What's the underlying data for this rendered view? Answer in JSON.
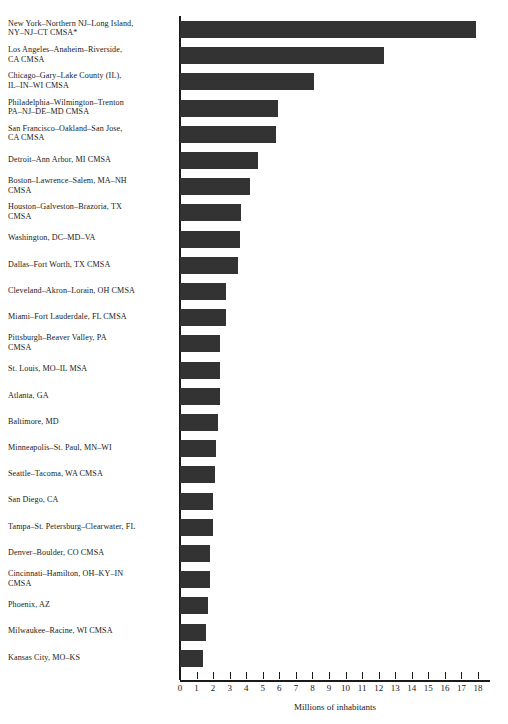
{
  "chart_data": {
    "type": "bar",
    "orientation": "horizontal",
    "title": "",
    "subtitle": "",
    "xlabel": "Millions of inhabitants",
    "ylabel": "",
    "xlim": [
      0,
      18
    ],
    "grid": false,
    "legend": null,
    "xticks": [
      0,
      1,
      2,
      3,
      4,
      5,
      6,
      7,
      8,
      9,
      10,
      11,
      12,
      13,
      14,
      15,
      16,
      17,
      18
    ],
    "xtick_labels": [
      "0",
      "1",
      "2",
      "3",
      "4",
      "5",
      "6",
      "7",
      "8",
      "9",
      "10",
      "11",
      "12",
      "13",
      "14",
      "15",
      "16",
      "17",
      "18"
    ],
    "bar_color": "#333333",
    "axis_color": "#1a1a1a",
    "categories": [
      "New York–Northern NJ–Long Island,\nNY–NJ–CT CMSA*",
      "Los Angeles–Anaheim–Riverside,\nCA CMSA",
      "Chicago–Gary–Lake County (IL),\nIL–IN–WI CMSA",
      "Philadelphia–Wilmington–Trenton\nPA–NJ–DE–MD CMSA",
      "San Francisco–Oakland–San Jose,\nCA CMSA",
      "Detroit–Ann Arbor, MI CMSA",
      "Boston–Lawrence–Salem, MA–NH\nCMSA",
      "Houston–Galveston–Brazoria, TX\nCMSA",
      "Washington, DC–MD–VA",
      "Dallas–Fort Worth, TX CMSA",
      "Cleveland–Akron–Lorain, OH CMSA",
      "Miami–Fort Lauderdale, FL CMSA",
      "Pittsburgh–Beaver Valley, PA\nCMSA",
      "St. Louis, MO–IL MSA",
      "Atlanta, GA",
      "Baltimore, MD",
      "Minneapolis–St. Paul, MN–WI",
      "Seattle–Tacoma, WA CMSA",
      "San Diego, CA",
      "Tampa–St. Petersburg–Clearwater, FL",
      "Denver–Boulder, CO CMSA",
      "Cincinnati–Hamilton, OH–KY–IN\nCMSA",
      "Phoenix, AZ",
      "Milwaukee–Racine, WI CMSA",
      "Kansas City, MO–KS"
    ],
    "values": [
      17.9,
      12.3,
      8.1,
      5.9,
      5.8,
      4.7,
      4.2,
      3.7,
      3.6,
      3.5,
      2.8,
      2.8,
      2.4,
      2.4,
      2.4,
      2.3,
      2.2,
      2.1,
      2.0,
      2.0,
      1.8,
      1.8,
      1.7,
      1.6,
      1.4
    ]
  }
}
